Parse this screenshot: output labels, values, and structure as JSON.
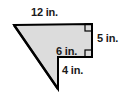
{
  "figure": {
    "kind": "composite-polygon",
    "fill_color": "#dcdcdc",
    "stroke_color": "#000000",
    "background_color": "#ffffff",
    "outline_points": "14,25 92,24 92,57 58,57 58,89",
    "right_angle_marks": [
      {
        "name": "right-angle-top-right",
        "x": 85,
        "y": 24,
        "size": 7
      },
      {
        "name": "right-angle-notch",
        "x": 85,
        "y": 50,
        "size": 7
      }
    ],
    "labels": {
      "top": "12 in.",
      "right": "5 in.",
      "notch": "6 in.",
      "vertical": "4 in."
    }
  }
}
